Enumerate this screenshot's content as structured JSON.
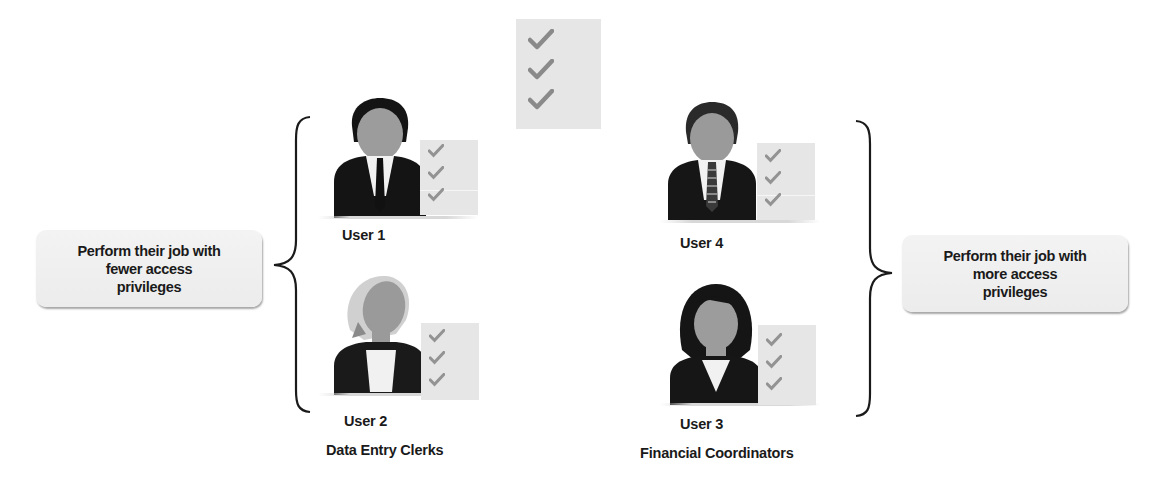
{
  "diagram": {
    "title": "",
    "left_group": {
      "callout_text_lines": [
        "Perform their job with",
        "fewer access",
        "privileges"
      ],
      "role_label": "Data Entry Clerks",
      "users": [
        {
          "id": "user-1",
          "label": "User 1",
          "avatar": "male-user-icon"
        },
        {
          "id": "user-2",
          "label": "User 2",
          "avatar": "female-user-icon"
        }
      ]
    },
    "right_group": {
      "callout_text_lines": [
        "Perform their job with",
        "more access",
        "privileges"
      ],
      "role_label": "Financial Coordinators",
      "users": [
        {
          "id": "user-4",
          "label": "User 4",
          "avatar": "male-user-icon"
        },
        {
          "id": "user-3",
          "label": "User 3",
          "avatar": "female-user-icon"
        }
      ]
    },
    "central_checklist": {
      "icon": "checklist-icon",
      "check_count": 3
    },
    "colors": {
      "text": "#1a1a1a",
      "checklist_bg": "#e6e6e6",
      "check": "#8c8c8c",
      "suit": "#141414",
      "face": "#9a9a9a",
      "callout_bg": "#efefef"
    }
  }
}
